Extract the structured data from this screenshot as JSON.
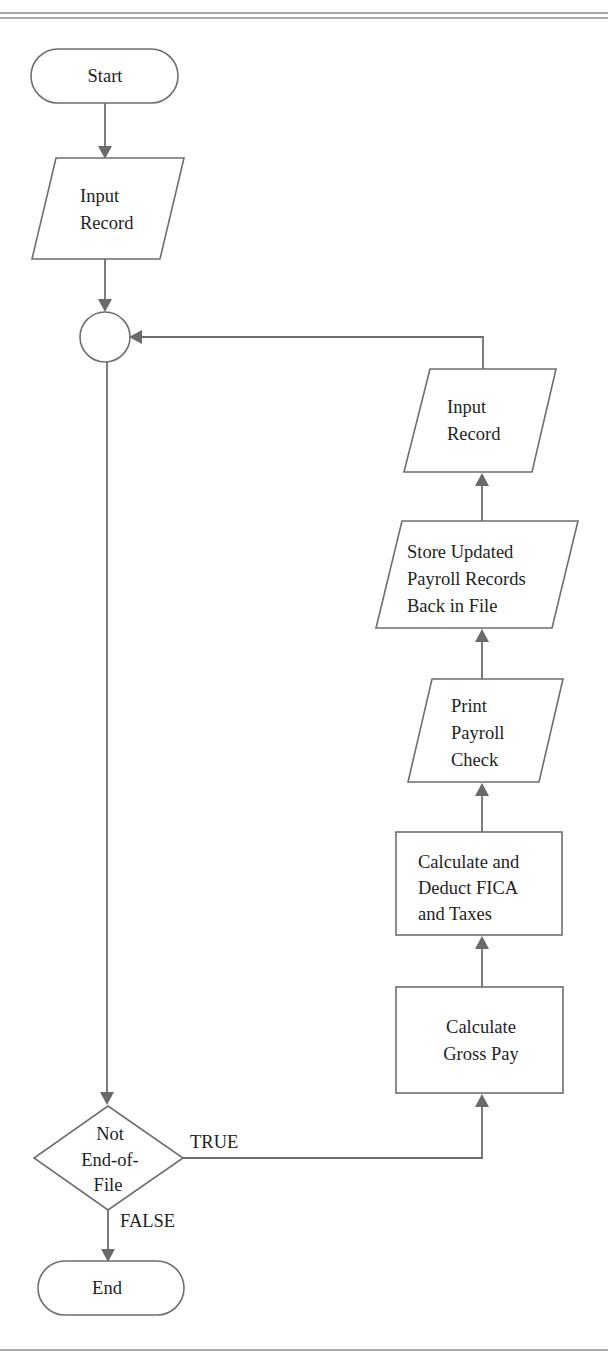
{
  "diagram": {
    "type": "flowchart",
    "title": "",
    "nodes": {
      "start": {
        "shape": "terminator",
        "lines": [
          "Start"
        ]
      },
      "input1": {
        "shape": "parallelogram",
        "lines": [
          "Input",
          "Record"
        ]
      },
      "connector": {
        "shape": "circle",
        "lines": []
      },
      "decision": {
        "shape": "diamond",
        "lines": [
          "Not",
          "End-of-",
          "File"
        ]
      },
      "gross": {
        "shape": "rectangle",
        "lines": [
          "Calculate",
          "Gross Pay"
        ]
      },
      "fica": {
        "shape": "rectangle",
        "lines": [
          "Calculate and",
          "Deduct FICA",
          "and Taxes"
        ]
      },
      "print": {
        "shape": "parallelogram",
        "lines": [
          "Print",
          "Payroll",
          "Check"
        ]
      },
      "store": {
        "shape": "parallelogram",
        "lines": [
          "Store Updated",
          "Payroll Records",
          "Back in File"
        ]
      },
      "input2": {
        "shape": "parallelogram",
        "lines": [
          "Input",
          "Record"
        ]
      },
      "end": {
        "shape": "terminator",
        "lines": [
          "End"
        ]
      }
    },
    "edges": [
      {
        "from": "start",
        "to": "input1",
        "label": ""
      },
      {
        "from": "input1",
        "to": "connector",
        "label": ""
      },
      {
        "from": "connector",
        "to": "decision",
        "label": ""
      },
      {
        "from": "decision",
        "to": "gross",
        "label": "TRUE"
      },
      {
        "from": "gross",
        "to": "fica",
        "label": ""
      },
      {
        "from": "fica",
        "to": "print",
        "label": ""
      },
      {
        "from": "print",
        "to": "store",
        "label": ""
      },
      {
        "from": "store",
        "to": "input2",
        "label": ""
      },
      {
        "from": "input2",
        "to": "connector",
        "label": ""
      },
      {
        "from": "decision",
        "to": "end",
        "label": "FALSE"
      }
    ],
    "edge_labels": {
      "true": "TRUE",
      "false": "FALSE"
    },
    "colors": {
      "stroke": "#6e6e6e",
      "text": "#1e1e1e",
      "background": "#ffffff"
    }
  }
}
